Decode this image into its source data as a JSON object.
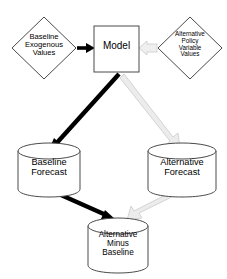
{
  "diagram": {
    "colors": {
      "shape_stroke": "#444444",
      "shape_fill": "#ffffff",
      "arrow_baseline": "#000000",
      "arrow_alternative": "#e2e2e2",
      "arrow_alternative_stroke": "#c9c9c9",
      "text": "#000000",
      "background": "#ffffff"
    },
    "nodes": [
      {
        "id": "baseline-exogenous-values",
        "shape": "diamond",
        "label": "Baseline\nExogenous\nValues",
        "x": 44,
        "y": 48
      },
      {
        "id": "alternative-policy-variable-values",
        "shape": "diamond",
        "label": "Alternative\nPolicy\nVariable\nValues",
        "x": 190,
        "y": 48
      },
      {
        "id": "model",
        "shape": "rectangle",
        "label": "Model",
        "x": 116,
        "y": 49
      },
      {
        "id": "baseline-forecast",
        "shape": "cylinder",
        "label": "Baseline\nForecast",
        "x": 49,
        "y": 170
      },
      {
        "id": "alternative-forecast",
        "shape": "cylinder",
        "label": "Alternative\nForecast",
        "x": 182,
        "y": 170
      },
      {
        "id": "alternative-minus-baseline",
        "shape": "cylinder",
        "label": "Alternative\nMinus\nBaseline",
        "x": 118,
        "y": 245
      }
    ],
    "edges": [
      {
        "id": "exogenous-to-model",
        "from": "baseline-exogenous-values",
        "to": "model",
        "style": "solid-black"
      },
      {
        "id": "policy-to-model",
        "from": "alternative-policy-variable-values",
        "to": "model",
        "style": "outline-gray"
      },
      {
        "id": "model-to-baseline-forecast",
        "from": "model",
        "to": "baseline-forecast",
        "style": "solid-black"
      },
      {
        "id": "model-to-alternative-forecast",
        "from": "model",
        "to": "alternative-forecast",
        "style": "outline-gray"
      },
      {
        "id": "baseline-forecast-to-difference",
        "from": "baseline-forecast",
        "to": "alternative-minus-baseline",
        "style": "solid-black"
      },
      {
        "id": "alternative-forecast-to-difference",
        "from": "alternative-forecast",
        "to": "alternative-minus-baseline",
        "style": "outline-gray"
      }
    ]
  }
}
